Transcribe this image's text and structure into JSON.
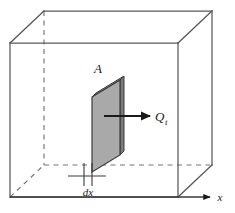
{
  "figure": {
    "type": "technical-line-diagram",
    "canvas": {
      "width": 235,
      "height": 213
    },
    "background_color": "#ffffff",
    "labels": {
      "area": "A",
      "heat_flow": "Q",
      "heat_flow_subscript": "t",
      "thickness": "dx",
      "axis_x": "x"
    },
    "colors": {
      "line": "#58585a",
      "hidden_line": "#6e6e70",
      "slab_face": "#a9a9a9",
      "slab_edge_dark": "#7d7d7d",
      "slab_top": "#8f8f8f",
      "slab_outline": "#3c3c3c",
      "arrow": "#1a1a1a",
      "text": "#1a1a1a"
    },
    "geometry": {
      "box_front": {
        "x1": 10,
        "y1": 43,
        "x2": 178,
        "y2": 197
      },
      "box_depth_offset": {
        "dx": 34,
        "dy": -32
      },
      "slab_front_face": "92,97 92,172 120,155 120,80",
      "slab_thickness_px": 5,
      "arrow_from": {
        "x": 106,
        "y": 116
      },
      "arrow_to": {
        "x": 150,
        "y": 116
      },
      "axis_from": {
        "x": 10,
        "y": 197
      },
      "axis_to": {
        "x": 212,
        "y": 197
      },
      "dim_line": {
        "x1": 68,
        "y1": 178,
        "x2": 104,
        "y2": 178
      },
      "dim_ticks_x": [
        84,
        92
      ]
    },
    "elements": [
      {
        "name": "outer-box",
        "desc": "wireframe cube / control volume"
      },
      {
        "name": "hidden-edges",
        "desc": "dashed back edges of the cube"
      },
      {
        "name": "slab",
        "desc": "shaded differential slab of area A and thickness dx"
      },
      {
        "name": "heat-arrow",
        "desc": "arrow indicating heat transfer rate out of slab"
      },
      {
        "name": "x-axis",
        "desc": "horizontal axis arrow labeled x"
      },
      {
        "name": "dimension-marker",
        "desc": "thickness dimension marker labeled dx"
      }
    ]
  }
}
